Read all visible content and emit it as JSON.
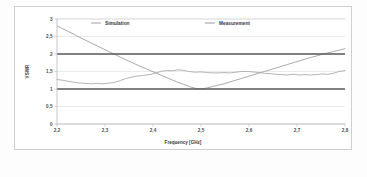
{
  "chart_data": {
    "type": "line",
    "title": "",
    "xlabel": "Frequency [GHz]",
    "ylabel": "VSWR",
    "xlim": [
      2.2,
      2.8
    ],
    "ylim": [
      0,
      3
    ],
    "grid": true,
    "legend_position": "top-inside",
    "xticks": [
      "2,2",
      "2,3",
      "2,4",
      "2,5",
      "2,6",
      "2,7",
      "2,8"
    ],
    "xtick_values": [
      2.2,
      2.3,
      2.4,
      2.5,
      2.6,
      2.7,
      2.8
    ],
    "yticks": [
      "0",
      "0,5",
      "1",
      "1,5",
      "2",
      "2,5",
      "3"
    ],
    "ytick_values": [
      0,
      0.5,
      1,
      1.5,
      2,
      2.5,
      3
    ],
    "reference_lines": [
      {
        "label": "VSWR 2",
        "value": 2,
        "color": "#595959"
      },
      {
        "label": "VSWR 1",
        "value": 1,
        "color": "#595959"
      }
    ],
    "series": [
      {
        "name": "Simulation",
        "color": "#9a9a9a",
        "x": [
          2.2,
          2.212,
          2.224,
          2.236,
          2.248,
          2.26,
          2.272,
          2.284,
          2.296,
          2.308,
          2.32,
          2.332,
          2.344,
          2.356,
          2.368,
          2.38,
          2.392,
          2.404,
          2.416,
          2.428,
          2.44,
          2.452,
          2.464,
          2.476,
          2.488,
          2.5,
          2.512,
          2.524,
          2.536,
          2.548,
          2.56,
          2.572,
          2.584,
          2.596,
          2.608,
          2.62,
          2.632,
          2.644,
          2.656,
          2.668,
          2.68,
          2.692,
          2.704,
          2.716,
          2.728,
          2.74,
          2.752,
          2.764,
          2.776,
          2.788,
          2.8
        ],
        "values": [
          2.8,
          2.72,
          2.64,
          2.56,
          2.47,
          2.39,
          2.31,
          2.23,
          2.15,
          2.07,
          1.99,
          1.91,
          1.83,
          1.76,
          1.68,
          1.61,
          1.54,
          1.47,
          1.4,
          1.33,
          1.26,
          1.19,
          1.13,
          1.07,
          1.02,
          1.0,
          1.03,
          1.07,
          1.11,
          1.15,
          1.2,
          1.25,
          1.3,
          1.35,
          1.4,
          1.45,
          1.5,
          1.55,
          1.6,
          1.65,
          1.7,
          1.75,
          1.8,
          1.85,
          1.9,
          1.94,
          1.99,
          2.03,
          2.07,
          2.11,
          2.15
        ]
      },
      {
        "name": "Measurement",
        "color": "#a6a6a6",
        "x": [
          2.2,
          2.212,
          2.224,
          2.236,
          2.248,
          2.26,
          2.272,
          2.284,
          2.296,
          2.308,
          2.32,
          2.332,
          2.344,
          2.356,
          2.368,
          2.38,
          2.392,
          2.404,
          2.416,
          2.428,
          2.44,
          2.452,
          2.464,
          2.476,
          2.488,
          2.5,
          2.512,
          2.524,
          2.536,
          2.548,
          2.56,
          2.572,
          2.584,
          2.596,
          2.608,
          2.62,
          2.632,
          2.644,
          2.656,
          2.668,
          2.68,
          2.692,
          2.704,
          2.716,
          2.728,
          2.74,
          2.752,
          2.764,
          2.776,
          2.788,
          2.8
        ],
        "values": [
          1.27,
          1.25,
          1.22,
          1.19,
          1.17,
          1.16,
          1.15,
          1.16,
          1.15,
          1.17,
          1.19,
          1.24,
          1.3,
          1.34,
          1.37,
          1.39,
          1.41,
          1.45,
          1.5,
          1.53,
          1.52,
          1.55,
          1.53,
          1.5,
          1.48,
          1.49,
          1.47,
          1.46,
          1.46,
          1.47,
          1.46,
          1.48,
          1.5,
          1.5,
          1.49,
          1.47,
          1.45,
          1.44,
          1.42,
          1.41,
          1.4,
          1.42,
          1.4,
          1.41,
          1.4,
          1.41,
          1.43,
          1.42,
          1.45,
          1.5,
          1.53
        ]
      }
    ]
  },
  "legend": {
    "items": [
      {
        "label": "Simulation"
      },
      {
        "label": "Measurement"
      }
    ]
  }
}
